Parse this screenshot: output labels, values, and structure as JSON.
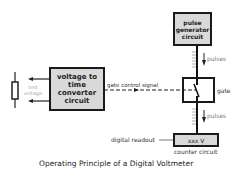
{
  "diagram": {
    "title": "Operating Principle of a Digital Voltmeter",
    "blocks": {
      "pulse_generator": "pulse generator circuit",
      "converter": "voltage to time converter circuit",
      "gate": "",
      "counter": "xxx V"
    },
    "labels": {
      "test_voltage": "test voltage",
      "gate_control_signal": "gate control signal",
      "gate": "gate",
      "pulses_upper": "pulses",
      "pulses_lower": "pulses",
      "digital_readout": "digital readout",
      "counter_circuit": "counter circuit"
    },
    "colors": {
      "block_fill": "#d9d9d9",
      "line": "#1a1a1a",
      "text": "#333333"
    }
  }
}
